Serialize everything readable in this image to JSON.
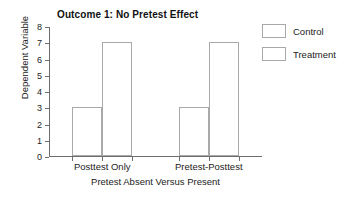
{
  "chart_data": {
    "type": "bar",
    "title": "Outcome 1: No Pretest Effect",
    "xlabel": "Pretest Absent Versus Present",
    "ylabel": "Dependent Variable",
    "categories": [
      "Posttest Only",
      "Pretest-Posttest"
    ],
    "series": [
      {
        "name": "Control",
        "values": [
          3,
          3
        ]
      },
      {
        "name": "Treatment",
        "values": [
          7,
          7
        ]
      }
    ],
    "ylim": [
      0,
      8
    ],
    "yticks": [
      0,
      1,
      2,
      3,
      4,
      5,
      6,
      7,
      8
    ],
    "ytick_labels": [
      "0",
      "1",
      "2",
      "3",
      "4",
      "5",
      "6",
      "7",
      "8"
    ],
    "grid": false,
    "legend_position": "top-right-outside",
    "colors": {
      "bar_fill": "#ffffff",
      "bar_edge": "#a9a9a9",
      "axis": "#6e6e6e",
      "text": "#222222",
      "title": "#111111",
      "background": "#ffffff"
    }
  }
}
